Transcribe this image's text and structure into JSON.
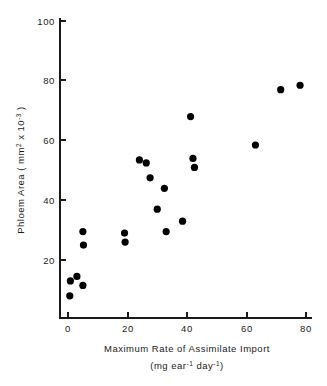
{
  "chart_data": {
    "type": "scatter",
    "title": "",
    "xlabel": "Maximum Rate of Assimilate Import",
    "xlabel_sub": "(mg ear⁻¹ day⁻¹)",
    "ylabel": "Phloem Area ( mm² x 10⁻³ )",
    "xlim": [
      0,
      80
    ],
    "ylim": [
      0,
      100
    ],
    "xticks": [
      0,
      20,
      40,
      60,
      80
    ],
    "yticks": [
      20,
      40,
      60,
      80,
      100
    ],
    "xtick_labels": [
      "0",
      "20",
      "40",
      "60",
      "80"
    ],
    "ytick_labels": [
      "20",
      "40",
      "60",
      "80",
      "100"
    ],
    "grid": false,
    "legend": false,
    "marker": "filled-circle",
    "marker_color": "#000000",
    "points": [
      {
        "x": 0.8,
        "y": 13.0
      },
      {
        "x": 0.6,
        "y": 8.0
      },
      {
        "x": 3.0,
        "y": 14.5
      },
      {
        "x": 5.0,
        "y": 11.5
      },
      {
        "x": 5.0,
        "y": 29.5
      },
      {
        "x": 5.2,
        "y": 25.0
      },
      {
        "x": 19.0,
        "y": 29.0
      },
      {
        "x": 19.2,
        "y": 26.0
      },
      {
        "x": 24.0,
        "y": 53.5
      },
      {
        "x": 26.3,
        "y": 52.5
      },
      {
        "x": 27.6,
        "y": 47.5
      },
      {
        "x": 30.0,
        "y": 37.0
      },
      {
        "x": 32.4,
        "y": 44.0
      },
      {
        "x": 33.0,
        "y": 29.5
      },
      {
        "x": 38.5,
        "y": 33.0
      },
      {
        "x": 41.2,
        "y": 68.0
      },
      {
        "x": 42.0,
        "y": 54.0
      },
      {
        "x": 42.5,
        "y": 51.0
      },
      {
        "x": 63.0,
        "y": 58.5
      },
      {
        "x": 71.5,
        "y": 77.0
      },
      {
        "x": 78.0,
        "y": 78.5
      }
    ]
  },
  "axis_labels": {
    "y_main": "Phloem Area ( mm",
    "y_sup1": "2",
    "y_mid": " x 10",
    "y_sup2": "-3",
    "y_close": " )",
    "x_main": "Maximum Rate of Assimilate Import",
    "x_sub_open": "(mg ear",
    "x_sub_sup1": "-1",
    "x_sub_mid": " day",
    "x_sub_sup2": "-1",
    "x_sub_close": ")"
  },
  "colors": {
    "axis": "#1a1a1a",
    "marker": "#000000",
    "background": "#ffffff"
  }
}
